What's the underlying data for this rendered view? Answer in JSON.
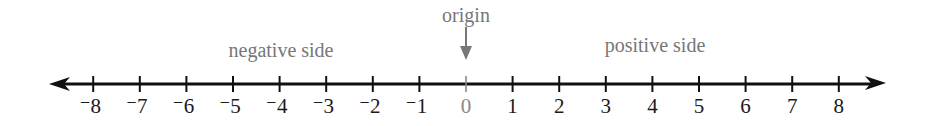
{
  "diagram": {
    "type": "number_line",
    "range": [
      -8,
      8
    ],
    "ticks": [
      {
        "value": -8,
        "label": "⁻8"
      },
      {
        "value": -7,
        "label": "⁻7"
      },
      {
        "value": -6,
        "label": "⁻6"
      },
      {
        "value": -5,
        "label": "⁻5"
      },
      {
        "value": -4,
        "label": "⁻4"
      },
      {
        "value": -3,
        "label": "⁻3"
      },
      {
        "value": -2,
        "label": "⁻2"
      },
      {
        "value": -1,
        "label": "⁻1"
      },
      {
        "value": 0,
        "label": "0"
      },
      {
        "value": 1,
        "label": "1"
      },
      {
        "value": 2,
        "label": "2"
      },
      {
        "value": 3,
        "label": "3"
      },
      {
        "value": 4,
        "label": "4"
      },
      {
        "value": 5,
        "label": "5"
      },
      {
        "value": 6,
        "label": "6"
      },
      {
        "value": 7,
        "label": "7"
      },
      {
        "value": 8,
        "label": "8"
      }
    ],
    "annotations": {
      "origin": "origin",
      "negative_side": "negative side",
      "positive_side": "positive side"
    },
    "colors": {
      "line": "#111111",
      "labels": "#1a1a1a",
      "annotation": "#777777",
      "zero": "#888888"
    }
  }
}
